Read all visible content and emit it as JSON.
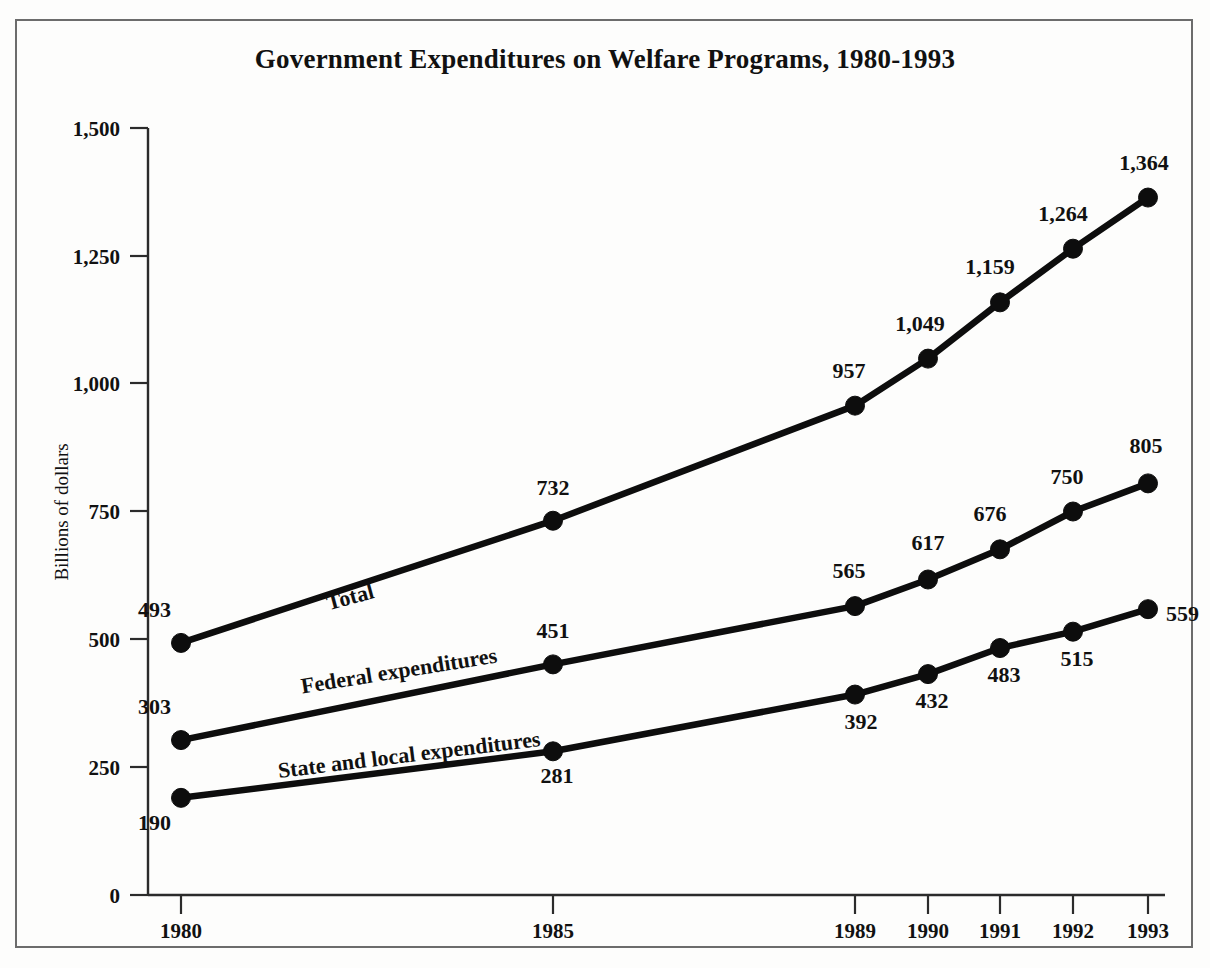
{
  "chart_data": {
    "type": "line",
    "title": "Government Expenditures on Welfare Programs, 1980-1993",
    "xlabel": "",
    "ylabel": "Billions of dollars",
    "x": [
      1980,
      1985,
      1989,
      1990,
      1991,
      1992,
      1993
    ],
    "categories": [
      "1980",
      "1985",
      "1989",
      "1990",
      "1991",
      "1992",
      "1993"
    ],
    "xtick_labels": [
      "1980",
      "1985",
      "1989",
      "1990",
      "1991",
      "1992",
      "1993"
    ],
    "ytick_labels": [
      "0",
      "250",
      "500",
      "750",
      "1,000",
      "1,250",
      "1,500"
    ],
    "ytick_values": [
      0,
      250,
      500,
      750,
      1000,
      1250,
      1500
    ],
    "ylim": [
      0,
      1500
    ],
    "xlim": [
      1979.2,
      1993.6
    ],
    "grid": false,
    "legend_position": "inline-on-lines",
    "series": [
      {
        "name": "Total",
        "values": [
          493,
          732,
          957,
          1049,
          1159,
          1264,
          1364
        ],
        "value_labels": [
          "493",
          "732",
          "957",
          "1,049",
          "1,159",
          "1,264",
          "1,364"
        ]
      },
      {
        "name": "Federal expenditures",
        "values": [
          303,
          451,
          565,
          617,
          676,
          750,
          805
        ],
        "value_labels": [
          "303",
          "451",
          "565",
          "617",
          "676",
          "750",
          "805"
        ]
      },
      {
        "name": "State and local expenditures",
        "values": [
          190,
          281,
          392,
          432,
          483,
          515,
          559
        ],
        "value_labels": [
          "190",
          "281",
          "392",
          "432",
          "483",
          "515",
          "559"
        ]
      }
    ],
    "colors": {
      "line": "#0d0d0d",
      "axis": "#2b2b2b",
      "text": "#111111",
      "background": "#fdfdfc",
      "frame": "#6c6c6c"
    }
  }
}
